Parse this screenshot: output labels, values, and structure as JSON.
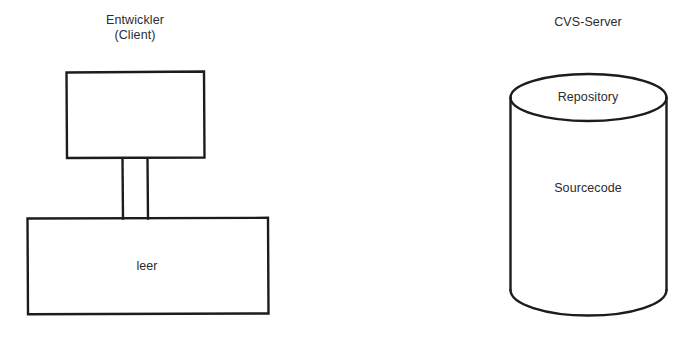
{
  "diagram": {
    "title_left": "Entwickler\n(Client)",
    "title_right": "CVS-Server",
    "client": {
      "caption_line1": "Entwickler",
      "caption_line2": "(Client)",
      "screen_label": "",
      "base_label": "leer"
    },
    "server": {
      "caption": "CVS-Server",
      "top_label": "Repository",
      "body_label": "Sourcecode"
    },
    "colors": {
      "background": "#ffffff",
      "stroke": "#1e1c1b",
      "text": "#2b2b2b"
    }
  }
}
